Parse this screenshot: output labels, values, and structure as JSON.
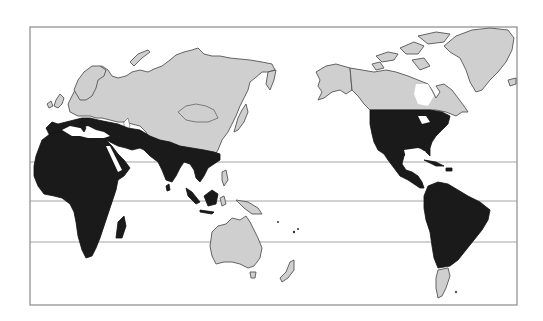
{
  "map": {
    "type": "world choropleth (Pacific-centered)",
    "legend": {
      "dark": {
        "color": "#1a1a1a",
        "regions": [
          "Africa",
          "Southern Europe / Mediterranean",
          "Middle East",
          "South Asia",
          "Southeast Asia",
          "Indonesia",
          "United States",
          "Mexico",
          "Central America",
          "Caribbean",
          "South America (except Patagonia)"
        ]
      },
      "light": {
        "color": "#cfcfcf",
        "regions": [
          "Northern Europe",
          "Russia",
          "Central Asia",
          "China",
          "Mongolia",
          "Japan",
          "Korea",
          "Australia",
          "New Zealand",
          "Canada",
          "Alaska",
          "Greenland",
          "Patagonia"
        ]
      }
    },
    "gridlines_count": 3,
    "frame_color": "#8a8a8a"
  }
}
